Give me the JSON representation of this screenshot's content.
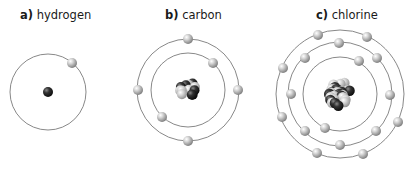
{
  "atoms": [
    {
      "letter": "a)",
      "name": "hydrogen",
      "label_x": 20,
      "center": [
        48,
        92
      ],
      "nucleus": {
        "protons": 1,
        "neutrons": 0,
        "radius": 5
      },
      "shells": [
        {
          "radius": 38,
          "electrons": [
            [
              72,
              63
            ]
          ]
        }
      ]
    },
    {
      "letter": "b)",
      "name": "carbon",
      "label_x": 165,
      "center": [
        188,
        90
      ],
      "nucleus": {
        "protons": 6,
        "neutrons": 6,
        "radius": 11
      },
      "shells": [
        {
          "radius": 37,
          "electrons": [
            [
              213,
              63
            ],
            [
              162,
              117
            ]
          ]
        },
        {
          "radius": 51,
          "electrons": [
            [
              188,
              39
            ],
            [
              138,
              90
            ],
            [
              238,
              90
            ],
            [
              188,
              141
            ]
          ]
        }
      ]
    },
    {
      "letter": "c)",
      "name": "chlorine",
      "label_x": 316,
      "center": [
        340,
        94
      ],
      "nucleus": {
        "protons": 17,
        "neutrons": 18,
        "radius": 15
      },
      "shells": [
        {
          "radius": 37,
          "electrons": [
            [
              359,
              61
            ],
            [
              325,
              128
            ]
          ]
        },
        {
          "radius": 52,
          "electrons": [
            [
              339,
              43
            ],
            [
              305,
              58
            ],
            [
              377,
              58
            ],
            [
              291,
              94
            ],
            [
              390,
              95
            ],
            [
              305,
              131
            ],
            [
              376,
              131
            ],
            [
              340,
              145
            ]
          ]
        },
        {
          "radius": 64,
          "electrons": [
            [
              318,
              35
            ],
            [
              367,
              37
            ],
            [
              283,
              68
            ],
            [
              398,
              122
            ],
            [
              282,
              117
            ],
            [
              317,
              153
            ],
            [
              363,
              154
            ]
          ]
        }
      ]
    }
  ],
  "colors": {
    "orbit": "#7a7a7a",
    "electron_light": "#eeeeee",
    "electron_dark": "#8c8c8c",
    "proton_dark": "#1e1e1e",
    "neutron_light": "#d8d8d8"
  }
}
